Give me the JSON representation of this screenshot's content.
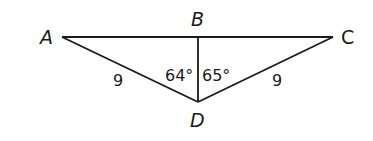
{
  "diagram": {
    "type": "geometry-triangle",
    "stroke_color": "#1a1a1a",
    "background": "#ffffff",
    "vertices": {
      "A": {
        "label": "A",
        "x": 62,
        "y": 37
      },
      "B": {
        "label": "B",
        "x": 198,
        "y": 37
      },
      "C": {
        "label": "C",
        "x": 333,
        "y": 37
      },
      "D": {
        "label": "D",
        "x": 198,
        "y": 102
      }
    },
    "segments": [
      {
        "from": "A",
        "to": "C"
      },
      {
        "from": "A",
        "to": "D"
      },
      {
        "from": "C",
        "to": "D"
      },
      {
        "from": "B",
        "to": "D"
      }
    ],
    "side_labels": {
      "AD": "9",
      "CD": "9"
    },
    "angle_labels": {
      "ADB": "64°",
      "BDC": "65°"
    }
  }
}
